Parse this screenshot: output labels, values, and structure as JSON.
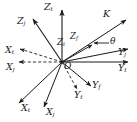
{
  "figure": {
    "background_color": "#ffffff",
    "line_color": "#1a1a1a",
    "width": 137,
    "height": 122
  },
  "origin": {
    "label": "O",
    "x": 62,
    "y": 62
  },
  "labels": {
    "z_t_vertical": "Z",
    "z_t_vertical_sub": "t",
    "z_j_upper_left": "Z",
    "z_j_upper_left_sub": "j",
    "z_t_center": "Z",
    "z_t_center_sub": "t",
    "z_f_center": "Z",
    "z_f_center_sub": "f",
    "k_vector": "K",
    "theta_angle": "θ",
    "x_t_dashed": "X",
    "x_t_dashed_sub": "t",
    "x_j_dashed": "X",
    "x_j_dashed_sub": "j",
    "x_t_lower": "X",
    "x_t_lower_sub": "t",
    "x_j_lower": "X",
    "x_j_lower_sub": "j",
    "y_j_right": "Y",
    "y_j_right_sub": "j",
    "y_t_right": "Y",
    "y_t_right_sub": "t",
    "y_f_lower": "Y",
    "y_f_lower_sub": "f",
    "y_t_lower": "Y",
    "y_t_lower_sub": "t"
  },
  "axes": [
    {
      "name": "z-t-axis",
      "style": "solid",
      "from": [
        62,
        62
      ],
      "to": [
        62,
        8
      ]
    },
    {
      "name": "z-j-axis",
      "style": "solid",
      "from": [
        62,
        62
      ],
      "to": [
        32,
        17
      ]
    },
    {
      "name": "k-vector",
      "style": "solid",
      "from": [
        62,
        62
      ],
      "to": [
        128,
        18
      ]
    },
    {
      "name": "z-center-vector",
      "style": "solid",
      "from": [
        62,
        62
      ],
      "to": [
        94,
        44
      ]
    },
    {
      "name": "y-j-axis",
      "style": "solid",
      "from": [
        62,
        62
      ],
      "to": [
        130,
        48
      ]
    },
    {
      "name": "y-t-axis",
      "style": "solid",
      "from": [
        62,
        62
      ],
      "to": [
        130,
        62
      ]
    },
    {
      "name": "x-t-dashed-axis",
      "style": "dashed",
      "from": [
        62,
        62
      ],
      "to": [
        16,
        48
      ]
    },
    {
      "name": "x-j-dashed-axis",
      "style": "dashed",
      "from": [
        62,
        62
      ],
      "to": [
        14,
        62
      ]
    },
    {
      "name": "x-t-lower-axis",
      "style": "solid",
      "from": [
        62,
        62
      ],
      "to": [
        17,
        105
      ]
    },
    {
      "name": "x-j-lower-axis",
      "style": "solid",
      "from": [
        62,
        62
      ],
      "to": [
        43,
        110
      ]
    },
    {
      "name": "y-f-lower-axis",
      "style": "solid",
      "from": [
        62,
        62
      ],
      "to": [
        93,
        89
      ]
    },
    {
      "name": "y-t-lower-axis",
      "style": "dashed",
      "from": [
        62,
        62
      ],
      "to": [
        78,
        92
      ]
    },
    {
      "name": "theta-arrow",
      "style": "solid",
      "from": [
        108,
        43
      ],
      "to": [
        92,
        43
      ]
    }
  ]
}
